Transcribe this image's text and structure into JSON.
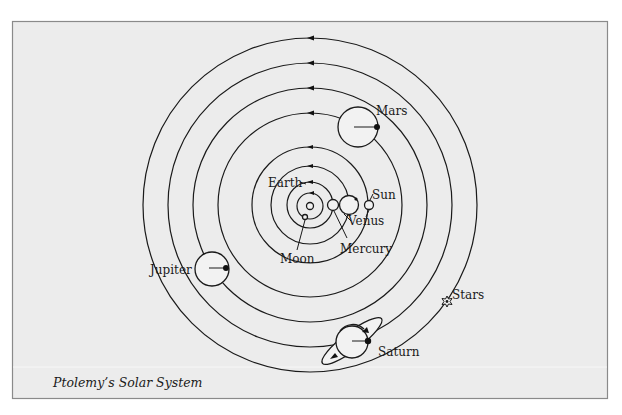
{
  "diagram": {
    "caption": "Ptolemy’s Solar System",
    "center": {
      "x": 310,
      "y": 205
    },
    "colors": {
      "background": "#ececec",
      "frame": "#8a8a8a",
      "ink": "#1a1a1a"
    },
    "orbits": [
      {
        "name": "moon-orbit",
        "radius": 13
      },
      {
        "name": "mercury-orbit",
        "radius": 23
      },
      {
        "name": "venus-orbit",
        "radius": 39
      },
      {
        "name": "sun-orbit",
        "radius": 58
      },
      {
        "name": "mars-orbit",
        "radius": 92
      },
      {
        "name": "jupiter-orbit",
        "radius": 117
      },
      {
        "name": "saturn-orbit",
        "radius": 142
      },
      {
        "name": "stars-orbit",
        "radius": 167
      }
    ],
    "labels": {
      "earth": "Earth",
      "moon": "Moon",
      "mercury": "Mercury",
      "venus": "Venus",
      "sun": "Sun",
      "mars": "Mars",
      "jupiter": "Jupiter",
      "saturn": "Saturn",
      "stars": "Stars"
    }
  }
}
